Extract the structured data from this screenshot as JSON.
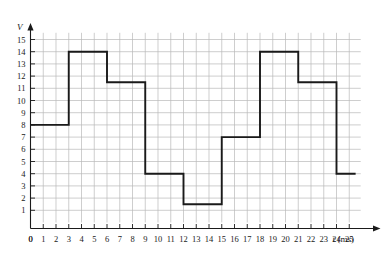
{
  "chart_data": {
    "type": "line",
    "title": "",
    "subtitle": "",
    "xlabel": "t (ms)",
    "ylabel": "V",
    "x_axis_name": "t",
    "x_axis_unit": "(ms)",
    "y_axis_name": "V",
    "xlim": [
      0,
      26
    ],
    "ylim": [
      0,
      16
    ],
    "grid": true,
    "legend": "none",
    "x_ticks": [
      0,
      1,
      2,
      3,
      4,
      5,
      6,
      7,
      8,
      9,
      10,
      11,
      12,
      13,
      14,
      15,
      16,
      17,
      18,
      19,
      20,
      21,
      22,
      23,
      24,
      25
    ],
    "x_tick_labels": [
      "0",
      "1",
      "2",
      "3",
      "4",
      "5",
      "6",
      "7",
      "8",
      "9",
      "10",
      "11",
      "12",
      "13",
      "14",
      "15",
      "16",
      "17",
      "18",
      "19",
      "20",
      "21",
      "22",
      "23",
      "24",
      "25"
    ],
    "y_ticks": [
      1,
      2,
      3,
      4,
      5,
      6,
      7,
      8,
      9,
      10,
      11,
      12,
      13,
      14,
      15
    ],
    "y_tick_labels": [
      "1",
      "2",
      "3",
      "4",
      "5",
      "6",
      "7",
      "8",
      "9",
      "10",
      "11",
      "12",
      "13",
      "14",
      "15"
    ],
    "y_axis_origin_label": "0",
    "series": [
      {
        "name": "V(t)",
        "style": "step",
        "color": "#1a1a1a",
        "steps": [
          {
            "t_start": 0,
            "t_end": 3,
            "value": 8
          },
          {
            "t_start": 3,
            "t_end": 6,
            "value": 14
          },
          {
            "t_start": 6,
            "t_end": 9,
            "value": 11.5
          },
          {
            "t_start": 9,
            "t_end": 12,
            "value": 4
          },
          {
            "t_start": 12,
            "t_end": 15,
            "value": 1.5
          },
          {
            "t_start": 15,
            "t_end": 18,
            "value": 7
          },
          {
            "t_start": 18,
            "t_end": 21,
            "value": 14
          },
          {
            "t_start": 21,
            "t_end": 24,
            "value": 11.5
          },
          {
            "t_start": 24,
            "t_end": 25.5,
            "value": 4
          }
        ],
        "points": [
          [
            0,
            8
          ],
          [
            3,
            8
          ],
          [
            3,
            14
          ],
          [
            6,
            14
          ],
          [
            6,
            11.5
          ],
          [
            9,
            11.5
          ],
          [
            9,
            4
          ],
          [
            12,
            4
          ],
          [
            12,
            1.5
          ],
          [
            15,
            1.5
          ],
          [
            15,
            7
          ],
          [
            18,
            7
          ],
          [
            18,
            14
          ],
          [
            21,
            14
          ],
          [
            21,
            11.5
          ],
          [
            24,
            11.5
          ],
          [
            24,
            4
          ],
          [
            25.5,
            4
          ]
        ]
      }
    ],
    "colors": {
      "trace": "#1a1a1a",
      "grid": "#b9b9b9",
      "axis": "#1a1a1a",
      "background": "#ffffff"
    }
  }
}
